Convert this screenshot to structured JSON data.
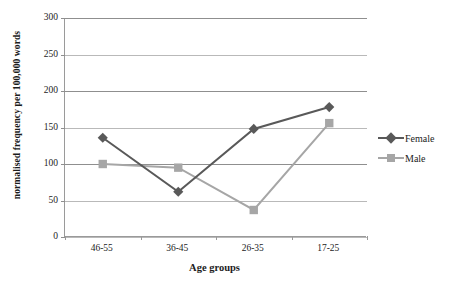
{
  "chart_data": {
    "type": "line",
    "title": "",
    "xlabel": "Age groups",
    "ylabel": "normalised frequency per 100,000 words",
    "categories": [
      "46-55",
      "36-45",
      "26-35",
      "17-25"
    ],
    "series": [
      {
        "name": "Female",
        "color": "#595959",
        "marker": "diamond",
        "values": [
          136,
          62,
          148,
          178
        ]
      },
      {
        "name": "Male",
        "color": "#a6a6a6",
        "marker": "square",
        "values": [
          100,
          95,
          37,
          156
        ]
      }
    ],
    "ylim": [
      0,
      300
    ],
    "yticks": [
      0,
      50,
      100,
      150,
      200,
      250,
      300
    ],
    "ytick_labels": [
      "0",
      "50",
      "100",
      "150",
      "200",
      "250",
      "300"
    ],
    "grid": true,
    "grid_axis": "y",
    "legend_position": "right"
  },
  "legend": {
    "entries": [
      {
        "label": "Female"
      },
      {
        "label": "Male"
      }
    ]
  },
  "axes": {
    "x_title": "Age groups",
    "y_title": "normalised frequency per 100,000 words"
  },
  "colors": {
    "female": "#595959",
    "male": "#a6a6a6",
    "gridline": "#b9b9b9",
    "gridline_major": "#8f8f8f",
    "axis": "#9a9a9a",
    "text": "#1c1c1c",
    "background": "#ffffff"
  }
}
